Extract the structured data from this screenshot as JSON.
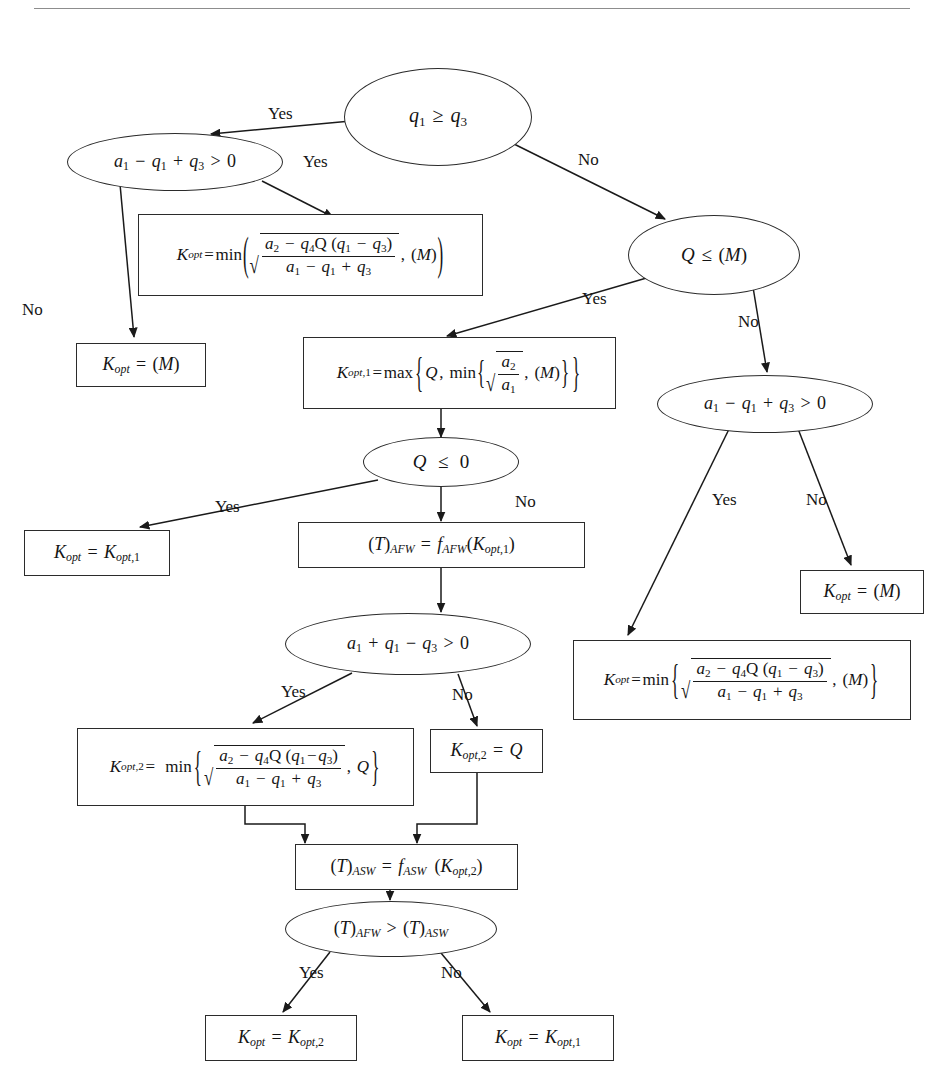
{
  "page": {
    "width": 949,
    "height": 1091,
    "background": "#ffffff",
    "ink_color": "#1a1a1a",
    "header_rule_color": "#8d8d8d"
  },
  "diagram": {
    "type": "flowchart",
    "decision_shape": "ellipse",
    "process_shape": "rectangle",
    "nodes": [
      {
        "id": "n1",
        "shape": "ellipse",
        "text": "q1 >= q3",
        "text_plain": "q₁ ≥ q₃"
      },
      {
        "id": "n2",
        "shape": "ellipse",
        "text": "a1 - q1 + q3 > 0",
        "text_plain": "a₁ − q₁ + q₃ > 0"
      },
      {
        "id": "n3",
        "shape": "box",
        "text": "Kopt = min( sqrt((a2 - q4 Q (q1 - q3))/(a1 - q1 + q3)), (M) )",
        "text_plain": "K_opt = min(√[(a₂ − q₄Q (q₁ − q₃))/(a₁ − q₁ + q₃)], (M))"
      },
      {
        "id": "n4",
        "shape": "box",
        "text": "Kopt = (M)",
        "text_plain": "K_opt = (M)"
      },
      {
        "id": "n5",
        "shape": "ellipse",
        "text": "Q <= (M)",
        "text_plain": "Q ≤ (M)"
      },
      {
        "id": "n6",
        "shape": "box",
        "text": "Kopt,1 = max{Q, min{sqrt(a2/a1), (M)}}",
        "text_plain": "K_opt,1 = max{Q, min{√(a₂/a₁), (M)}}"
      },
      {
        "id": "n7",
        "shape": "ellipse",
        "text": "Q <= 0",
        "text_plain": "Q ≤ 0"
      },
      {
        "id": "n8",
        "shape": "box",
        "text": "Kopt = Kopt,1",
        "text_plain": "K_opt = K_opt,1"
      },
      {
        "id": "n9",
        "shape": "box",
        "text": "(T)AFW = fAFW(Kopt,1)",
        "text_plain": "(T)_AFW = f_AFW(K_opt,1)"
      },
      {
        "id": "n10",
        "shape": "ellipse",
        "text": "a1 - q1 + q3 > 0",
        "text_plain": "a₁ − q₁ + q₃ > 0"
      },
      {
        "id": "n11",
        "shape": "box",
        "text": "Kopt = (M)",
        "text_plain": "K_opt = (M)"
      },
      {
        "id": "n12",
        "shape": "box",
        "text": "Kopt = min{ sqrt((a2 - q4 Q (q1 - q3))/(a1 - q1 + q3)), (M) }",
        "text_plain": "K_opt = min{√[(a₂ − q₄Q (q₁ − q₃))/(a₁ − q₁ + q₃)], (M)}"
      },
      {
        "id": "n13",
        "shape": "ellipse",
        "text": "a1 + q1 - q3 > 0",
        "text_plain": "a₁ + q₁ − q₃ > 0"
      },
      {
        "id": "n14",
        "shape": "box",
        "text": "Kopt,2 = min{ sqrt((a2 - q4 Q (q1-q3))/(a1 - q1 + q3)), Q }",
        "text_plain": "K_opt,2 = min{√[(a₂ − q₄Q (q₁−q₃))/(a₁ − q₁ + q₃)], Q}"
      },
      {
        "id": "n15",
        "shape": "box",
        "text": "Kopt,2 = Q",
        "text_plain": "K_opt,2 = Q"
      },
      {
        "id": "n16",
        "shape": "box",
        "text": "(T)ASW = fASW(Kopt,2)",
        "text_plain": "(T)_ASW = f_ASW(K_opt,2)"
      },
      {
        "id": "n17",
        "shape": "ellipse",
        "text": "(T)AFW > (T)ASW",
        "text_plain": "(T)_AFW > (T)_ASW"
      },
      {
        "id": "n18",
        "shape": "box",
        "text": "Kopt = Kopt,2",
        "text_plain": "K_opt = K_opt,2"
      },
      {
        "id": "n19",
        "shape": "box",
        "text": "Kopt = Kopt,1",
        "text_plain": "K_opt = K_opt,1"
      }
    ],
    "edge_labels": [
      {
        "id": "e1",
        "label": "Yes",
        "from": "n1",
        "to": "n2"
      },
      {
        "id": "e2",
        "label": "No",
        "from": "n1",
        "to": "n5"
      },
      {
        "id": "e3",
        "label": "Yes",
        "from": "n2",
        "to": "n3"
      },
      {
        "id": "e4",
        "label": "No",
        "from": "n2",
        "to": "n4"
      },
      {
        "id": "e5",
        "label": "Yes",
        "from": "n5",
        "to": "n6"
      },
      {
        "id": "e6",
        "label": "No",
        "from": "n5",
        "to": "n10"
      },
      {
        "id": "e7",
        "label": "Yes",
        "from": "n7",
        "to": "n8"
      },
      {
        "id": "e8",
        "label": "No",
        "from": "n7",
        "to": "n9"
      },
      {
        "id": "e9",
        "label": "Yes",
        "from": "n10",
        "to": "n12"
      },
      {
        "id": "e10",
        "label": "No",
        "from": "n10",
        "to": "n11"
      },
      {
        "id": "e11",
        "label": "Yes",
        "from": "n13",
        "to": "n14"
      },
      {
        "id": "e12",
        "label": "No",
        "from": "n13",
        "to": "n15"
      },
      {
        "id": "e13",
        "label": "Yes",
        "from": "n17",
        "to": "n18"
      },
      {
        "id": "e14",
        "label": "No",
        "from": "n17",
        "to": "n19"
      }
    ]
  },
  "labels": {
    "yes": "Yes",
    "no": "No",
    "min": "min",
    "max": "max",
    "K": "K",
    "opt": "opt",
    "opt1": "opt,1",
    "opt2": "opt,2",
    "Q": "Q",
    "M": "M",
    "T": "T",
    "AFW": "AFW",
    "ASW": "ASW",
    "f": "f",
    "a": "a",
    "q": "q",
    "one": "1",
    "two": "2",
    "three": "3",
    "four": "4",
    "zero": "0",
    "eq": "=",
    "gt": ">",
    "ge": "≥",
    "le": "≤",
    "minus": "−",
    "plus": "+",
    "comma": ",",
    "lparen": "(",
    "rparen": ")",
    "lbrace": "{",
    "rbrace": "}",
    "radical": "√"
  }
}
